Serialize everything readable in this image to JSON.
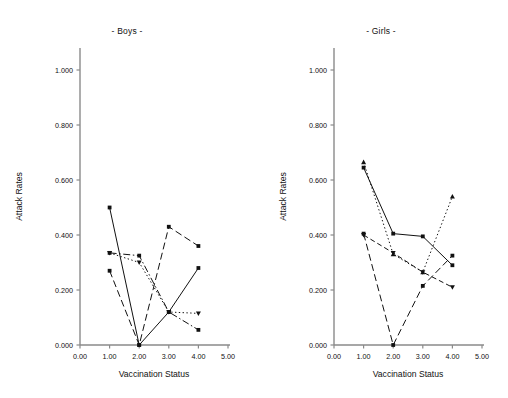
{
  "figure": {
    "background": "#ffffff",
    "ink": "#111111",
    "axis_color": "#8a8a8a"
  },
  "axes": {
    "xlabel": "Vaccination Status",
    "ylabel": "Attack Rates",
    "xticks": [
      "0.00",
      "1.00",
      "2.00",
      "3.00",
      "4.00",
      "5.00"
    ],
    "xtick_values": [
      0,
      1,
      2,
      3,
      4,
      5
    ],
    "yticks": [
      "0.000",
      "0.200",
      "0.400",
      "0.600",
      "0.800",
      "1.000"
    ],
    "ytick_values": [
      0,
      0.2,
      0.4,
      0.6,
      0.8,
      1.0
    ],
    "xlim": [
      0,
      5
    ],
    "ylim": [
      0,
      1.08
    ],
    "grid": false,
    "legend": "none"
  },
  "chart_data": [
    {
      "type": "line",
      "title": "- Boys -",
      "xlabel": "Vaccination Status",
      "ylabel": "Attack Rates",
      "xlim": [
        0,
        5
      ],
      "ylim": [
        0,
        1.08
      ],
      "grid": false,
      "legend": "none",
      "x": [
        1.0,
        2.0,
        3.0,
        4.0
      ],
      "series": [
        {
          "name": "series-1",
          "style": "solid",
          "marker": "square",
          "values": [
            0.5,
            0.0,
            0.12,
            0.28
          ]
        },
        {
          "name": "series-2",
          "style": "dashed",
          "marker": "square",
          "values": [
            0.27,
            0.0,
            0.43,
            0.36
          ]
        },
        {
          "name": "series-3",
          "style": "dotted",
          "marker": "triangle-down",
          "values": [
            0.335,
            0.3,
            0.12,
            0.115
          ]
        },
        {
          "name": "series-4",
          "style": "dashdot",
          "marker": "square",
          "values": [
            0.335,
            0.325,
            0.12,
            0.055
          ]
        }
      ]
    },
    {
      "type": "line",
      "title": "- Girls -",
      "xlabel": "Vaccination Status",
      "ylabel": "Attack Rates",
      "xlim": [
        0,
        5
      ],
      "ylim": [
        0,
        1.08
      ],
      "grid": false,
      "legend": "none",
      "x": [
        1.0,
        2.0,
        3.0,
        4.0
      ],
      "series": [
        {
          "name": "series-1",
          "style": "solid",
          "marker": "square",
          "values": [
            0.645,
            0.405,
            0.395,
            0.29
          ]
        },
        {
          "name": "series-2",
          "style": "dashed",
          "marker": "square",
          "values": [
            0.405,
            0.0,
            0.215,
            0.325
          ]
        },
        {
          "name": "series-3",
          "style": "dotted",
          "marker": "triangle-up",
          "values": [
            0.665,
            0.33,
            0.265,
            0.54
          ]
        },
        {
          "name": "series-4",
          "style": "dashed2",
          "marker": "triangle-down",
          "values": [
            0.4,
            0.335,
            0.265,
            0.21
          ]
        }
      ]
    }
  ]
}
